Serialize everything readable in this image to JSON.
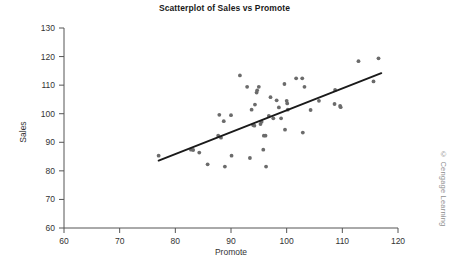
{
  "chart_data": {
    "type": "scatter",
    "title": "Scatterplot of Sales vs Promote",
    "xlabel": "Promote",
    "ylabel": "Sales",
    "xlim": [
      60,
      120
    ],
    "ylim": [
      60,
      130
    ],
    "xticks": [
      60,
      70,
      80,
      90,
      100,
      110,
      120
    ],
    "yticks": [
      60,
      70,
      80,
      90,
      100,
      110,
      120,
      130
    ],
    "grid": false,
    "legend": null,
    "marker_color": "#6b6b6b",
    "line_color": "#1a1a1a",
    "series": [
      {
        "name": "Sales vs Promote",
        "points": [
          [
            77.0,
            85.3
          ],
          [
            82.8,
            87.4
          ],
          [
            83.2,
            87.3
          ],
          [
            84.3,
            86.4
          ],
          [
            85.8,
            82.3
          ],
          [
            87.7,
            92.3
          ],
          [
            87.9,
            99.6
          ],
          [
            88.2,
            91.6
          ],
          [
            88.7,
            97.4
          ],
          [
            88.9,
            81.5
          ],
          [
            90.0,
            99.5
          ],
          [
            90.1,
            85.3
          ],
          [
            91.6,
            113.4
          ],
          [
            92.9,
            109.4
          ],
          [
            93.4,
            84.5
          ],
          [
            93.7,
            101.4
          ],
          [
            94.0,
            96.0
          ],
          [
            94.2,
            95.8
          ],
          [
            94.3,
            103.2
          ],
          [
            94.6,
            107.4
          ],
          [
            94.7,
            108.2
          ],
          [
            95.0,
            109.4
          ],
          [
            95.3,
            96.4
          ],
          [
            95.5,
            97.2
          ],
          [
            95.8,
            87.4
          ],
          [
            95.9,
            92.3
          ],
          [
            96.2,
            92.3
          ],
          [
            96.3,
            81.5
          ],
          [
            96.8,
            99.2
          ],
          [
            97.1,
            105.8
          ],
          [
            97.6,
            98.4
          ],
          [
            98.2,
            104.7
          ],
          [
            98.6,
            102.2
          ],
          [
            99.0,
            98.4
          ],
          [
            99.6,
            110.4
          ],
          [
            99.7,
            94.4
          ],
          [
            100.0,
            104.5
          ],
          [
            100.1,
            103.6
          ],
          [
            100.2,
            101.4
          ],
          [
            101.7,
            112.4
          ],
          [
            102.8,
            112.4
          ],
          [
            102.9,
            93.4
          ],
          [
            103.2,
            109.4
          ],
          [
            104.3,
            101.3
          ],
          [
            105.8,
            104.5
          ],
          [
            108.6,
            103.4
          ],
          [
            108.7,
            108.3
          ],
          [
            109.6,
            102.7
          ],
          [
            109.7,
            102.3
          ],
          [
            112.9,
            118.4
          ],
          [
            115.6,
            111.3
          ],
          [
            116.5,
            119.4
          ]
        ]
      }
    ],
    "trendline": {
      "name": "least-squares-fit",
      "x_start": 77.0,
      "y_start": 83.6,
      "x_end": 117.0,
      "y_end": 114.2
    }
  },
  "credit": {
    "text": "© Cengage Learning"
  }
}
